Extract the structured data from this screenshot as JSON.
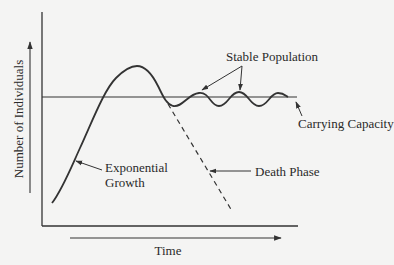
{
  "diagram": {
    "colors": {
      "ink": "#2a2a2a",
      "line": "#333333",
      "background": "#f4f4f3"
    },
    "axes": {
      "x_label": "Time",
      "y_label": "Number of Individuals"
    },
    "reference_line": {
      "label": "Carrying Capacity"
    },
    "annotations": {
      "exponential_growth": {
        "line1": "Exponential",
        "line2": "Growth"
      },
      "stable_population": "Stable Population",
      "death_phase": "Death Phase",
      "carrying_capacity": "Carrying Capacity"
    }
  }
}
